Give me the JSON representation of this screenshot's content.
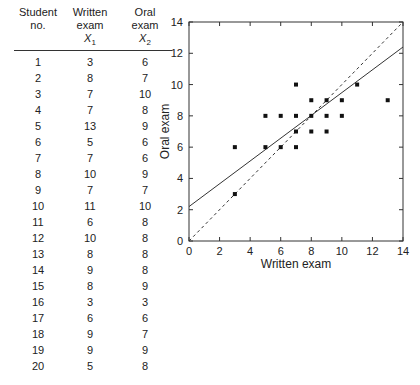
{
  "table": {
    "headers": [
      {
        "lines": [
          "Student",
          "no."
        ],
        "sub": ""
      },
      {
        "lines": [
          "Written",
          "exam"
        ],
        "sub": "X",
        "sub_index": "1"
      },
      {
        "lines": [
          "Oral",
          "exam"
        ],
        "sub": "X",
        "sub_index": "2"
      }
    ],
    "rows": [
      [
        "1",
        "3",
        "6"
      ],
      [
        "2",
        "8",
        "7"
      ],
      [
        "3",
        "7",
        "10"
      ],
      [
        "4",
        "7",
        "8"
      ],
      [
        "5",
        "13",
        "9"
      ],
      [
        "6",
        "5",
        "6"
      ],
      [
        "7",
        "7",
        "6"
      ],
      [
        "8",
        "10",
        "9"
      ],
      [
        "9",
        "7",
        "7"
      ],
      [
        "10",
        "11",
        "10"
      ],
      [
        "11",
        "6",
        "8"
      ],
      [
        "12",
        "10",
        "8"
      ],
      [
        "13",
        "8",
        "8"
      ],
      [
        "14",
        "9",
        "8"
      ],
      [
        "15",
        "8",
        "9"
      ],
      [
        "16",
        "3",
        "3"
      ],
      [
        "17",
        "6",
        "6"
      ],
      [
        "18",
        "9",
        "7"
      ],
      [
        "19",
        "9",
        "9"
      ],
      [
        "20",
        "5",
        "8"
      ]
    ]
  },
  "chart_data": {
    "type": "scatter",
    "title": "",
    "xlabel": "Written exam",
    "ylabel": "Oral exam",
    "xlim": [
      0,
      14
    ],
    "ylim": [
      0,
      14
    ],
    "xticks": [
      0,
      2,
      4,
      6,
      8,
      10,
      12,
      14
    ],
    "yticks": [
      0,
      2,
      4,
      6,
      8,
      10,
      12,
      14
    ],
    "grid": false,
    "series": [
      {
        "name": "Students",
        "marker": "square",
        "x": [
          3,
          8,
          7,
          7,
          13,
          5,
          7,
          10,
          7,
          11,
          6,
          10,
          8,
          9,
          8,
          3,
          6,
          9,
          9,
          5
        ],
        "y": [
          6,
          7,
          10,
          8,
          9,
          6,
          6,
          9,
          7,
          10,
          8,
          8,
          8,
          8,
          9,
          3,
          6,
          7,
          9,
          8
        ]
      }
    ],
    "lines": [
      {
        "name": "Regression line",
        "style": "solid",
        "x": [
          0,
          14
        ],
        "y": [
          2.2,
          12.4
        ]
      },
      {
        "name": "Line of identity",
        "style": "dashed",
        "x": [
          0,
          14
        ],
        "y": [
          0,
          14
        ]
      }
    ]
  }
}
